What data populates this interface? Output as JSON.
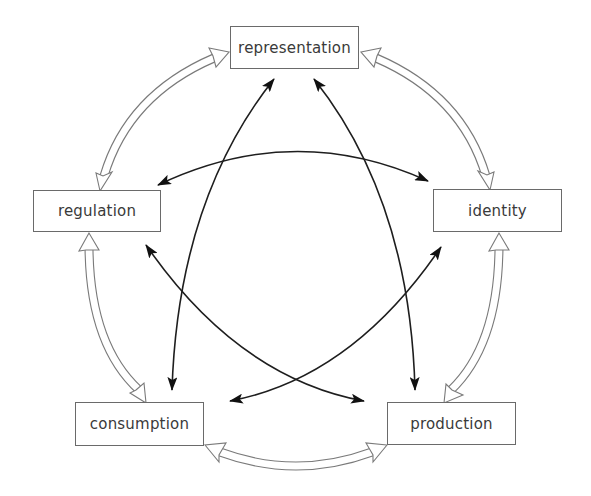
{
  "diagram": {
    "type": "circuit",
    "nodes": {
      "representation": {
        "label": "representation"
      },
      "regulation": {
        "label": "regulation"
      },
      "identity": {
        "label": "identity"
      },
      "consumption": {
        "label": "consumption"
      },
      "production": {
        "label": "production"
      }
    },
    "outer_links": [
      {
        "from": "representation",
        "to": "identity",
        "style": "hollow double-headed"
      },
      {
        "from": "identity",
        "to": "production",
        "style": "hollow double-headed"
      },
      {
        "from": "production",
        "to": "consumption",
        "style": "hollow double-headed"
      },
      {
        "from": "consumption",
        "to": "regulation",
        "style": "hollow double-headed"
      },
      {
        "from": "regulation",
        "to": "representation",
        "style": "hollow double-headed"
      }
    ],
    "inner_links": [
      {
        "from": "representation",
        "to": "consumption",
        "style": "solid double-headed"
      },
      {
        "from": "representation",
        "to": "production",
        "style": "solid double-headed"
      },
      {
        "from": "regulation",
        "to": "identity",
        "style": "solid double-headed"
      },
      {
        "from": "regulation",
        "to": "production",
        "style": "solid double-headed"
      },
      {
        "from": "identity",
        "to": "consumption",
        "style": "solid double-headed"
      }
    ],
    "colors": {
      "box_border": "#6a6a6a",
      "text": "#3a3a3a",
      "solid_arrow": "#1e1e1e",
      "hollow_arrow": "#7a7a7a"
    }
  }
}
